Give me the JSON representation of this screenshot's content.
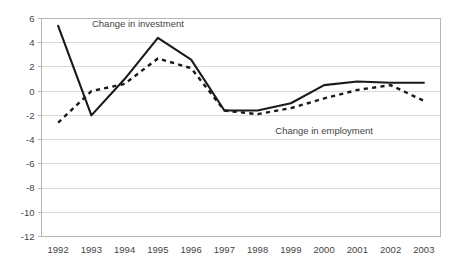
{
  "chart_data": {
    "type": "line",
    "title": "",
    "subtitle": "",
    "xlabel": "",
    "ylabel": "",
    "categories": [
      "1992",
      "1993",
      "1994",
      "1995",
      "1996",
      "1997",
      "1998",
      "1999",
      "2000",
      "2001",
      "2002",
      "2003"
    ],
    "x_tick_labels": [
      "1992",
      "1993",
      "1994",
      "1995",
      "1996",
      "1997",
      "1998",
      "1999",
      "2000",
      "2001",
      "2002",
      "2003"
    ],
    "y_tick_labels": [
      "6",
      "4",
      "2",
      "0",
      "-2",
      "-4",
      "-6",
      "-8",
      "-10",
      "-12"
    ],
    "y_ticks": [
      6,
      4,
      2,
      0,
      -2,
      -4,
      -6,
      -8,
      -10,
      -12
    ],
    "ylim": [
      -12,
      6
    ],
    "grid": "horizontal",
    "legend_position": "inline-annotation",
    "series": [
      {
        "name": "Change in investment",
        "style": "solid",
        "color": "#1a1a1a",
        "values": [
          5.4,
          -2.0,
          1.0,
          4.4,
          2.6,
          -1.6,
          -1.6,
          -1.0,
          0.5,
          0.8,
          0.7,
          0.7
        ]
      },
      {
        "name": "Change in employment",
        "style": "dashed",
        "color": "#1a1a1a",
        "values": [
          -2.6,
          0.0,
          0.6,
          2.7,
          1.9,
          -1.6,
          -1.9,
          -1.4,
          -0.6,
          0.1,
          0.5,
          -0.8
        ]
      }
    ],
    "annotations": [
      {
        "text": "Change in investment",
        "x_value": 1994.4,
        "y_value": 5.3
      },
      {
        "text": "Change in employment",
        "x_value": 2000.0,
        "y_value": -3.5
      }
    ]
  }
}
